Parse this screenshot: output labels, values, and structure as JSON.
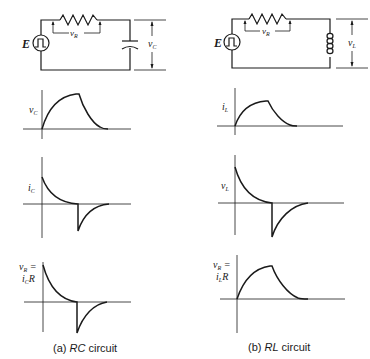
{
  "figure": {
    "panels": [
      {
        "id": "rc",
        "caption_prefix": "(a) ",
        "caption_italic": "RC",
        "caption_suffix": " circuit",
        "circuit": {
          "source_label": "E",
          "resistor_voltage_label": "v",
          "resistor_voltage_sub": "R",
          "element": "capacitor",
          "element_voltage_label": "v",
          "element_voltage_sub": "C"
        },
        "graphs": [
          {
            "label": "v",
            "sub": "C",
            "shape": "charge-discharge"
          },
          {
            "label": "i",
            "sub": "C",
            "shape": "positive-decay then negative-decay"
          },
          {
            "label_line1": "v",
            "label_line1_sub": "R",
            "label_line1_suffix": " =",
            "label_line2": "i",
            "label_line2_sub": "C",
            "label_line2_suffix": "R",
            "shape": "positive-decay then negative-decay"
          }
        ]
      },
      {
        "id": "rl",
        "caption_prefix": "(b) ",
        "caption_italic": "RL",
        "caption_suffix": " circuit",
        "circuit": {
          "source_label": "E",
          "resistor_voltage_label": "v",
          "resistor_voltage_sub": "R",
          "element": "inductor",
          "element_voltage_label": "v",
          "element_voltage_sub": "L"
        },
        "graphs": [
          {
            "label": "i",
            "sub": "L",
            "shape": "charge-discharge"
          },
          {
            "label": "v",
            "sub": "L",
            "shape": "positive-decay then negative-decay"
          },
          {
            "label_line1": "v",
            "label_line1_sub": "R",
            "label_line1_suffix": " =",
            "label_line2": "i",
            "label_line2_sub": "L",
            "label_line2_suffix": "R",
            "shape": "charge-discharge"
          }
        ]
      }
    ]
  }
}
